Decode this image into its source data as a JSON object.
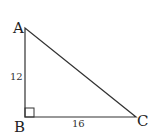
{
  "diagram": {
    "type": "right-triangle",
    "colors": {
      "stroke": "#333333",
      "text": "#222222",
      "background": "#ffffff"
    },
    "vertices": {
      "A": {
        "label": "A",
        "x": 25,
        "y": 28
      },
      "B": {
        "label": "B",
        "x": 25,
        "y": 117
      },
      "C": {
        "label": "C",
        "x": 136,
        "y": 117
      }
    },
    "sides": {
      "AB": {
        "label": "12"
      },
      "BC": {
        "label": "16"
      }
    },
    "right_angle_at": "B"
  }
}
